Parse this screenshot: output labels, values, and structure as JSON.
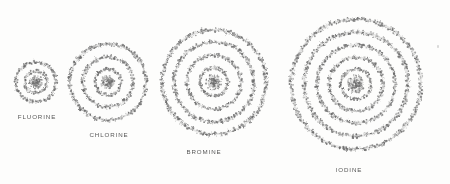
{
  "figure": {
    "background_color": "#fdfdfc",
    "ink_color": "#6b6b6b",
    "label_color": "#4a4a4a",
    "width": 450,
    "height": 184
  },
  "chart_data": {
    "type": "diagram",
    "subtitle": "",
    "xlabel": "",
    "ylabel": "",
    "legend_position": "none",
    "grid": false,
    "categories": [
      "FLUORINE",
      "CHLORINE",
      "BROMINE",
      "IODINE"
    ],
    "values": [
      2,
      3,
      4,
      5
    ],
    "series": [
      {
        "name": "electron shell rings",
        "values": [
          2,
          3,
          4,
          5
        ]
      },
      {
        "name": "outer radius (px)",
        "values": [
          20,
          38,
          52,
          65
        ]
      }
    ],
    "atoms": [
      {
        "label": "FLUORINE",
        "cx": 36,
        "cy": 82,
        "nucleus_radius": 5,
        "ring_count": 2,
        "ring_radii": [
          11,
          20
        ],
        "label_x": 33,
        "label_y": 113
      },
      {
        "label": "CHLORINE",
        "cx": 108,
        "cy": 82,
        "nucleus_radius": 5.5,
        "ring_count": 3,
        "ring_radii": [
          13,
          25,
          38
        ],
        "label_x": 106,
        "label_y": 131
      },
      {
        "label": "BROMINE",
        "cx": 214,
        "cy": 82,
        "nucleus_radius": 6,
        "ring_count": 4,
        "ring_radii": [
          14,
          27,
          40,
          52
        ],
        "label_x": 200,
        "label_y": 148
      },
      {
        "label": "IODINE",
        "cx": 356,
        "cy": 84,
        "nucleus_radius": 6.5,
        "ring_count": 5,
        "ring_radii": [
          15,
          27,
          39,
          52,
          65
        ],
        "label_x": 342,
        "label_y": 166
      }
    ],
    "artifacts": [
      {
        "name": "scan-speck",
        "x": 437,
        "y": 45
      }
    ]
  }
}
